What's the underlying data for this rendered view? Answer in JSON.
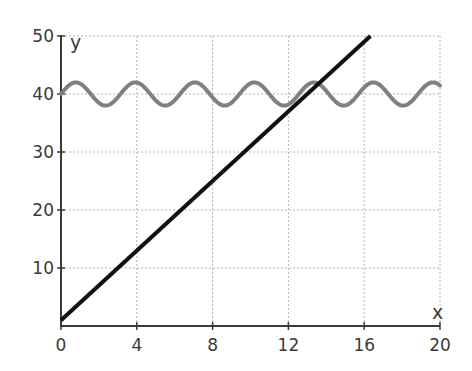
{
  "chart_data": {
    "type": "line",
    "title": "",
    "xlabel": "x",
    "ylabel": "y",
    "xlim": [
      0,
      20
    ],
    "ylim": [
      0,
      50
    ],
    "x_ticks": [
      0,
      4,
      8,
      12,
      16,
      20
    ],
    "y_ticks": [
      10,
      20,
      30,
      40,
      50
    ],
    "x_tick_labels": [
      "0",
      "4",
      "8",
      "12",
      "16",
      "20"
    ],
    "y_tick_labels": [
      "10",
      "20",
      "30",
      "40",
      "50"
    ],
    "grid": true,
    "legend": null,
    "series": [
      {
        "name": "linear",
        "color": "#111111",
        "equation": "y = 3x + 1",
        "x": [
          0,
          16.33
        ],
        "y": [
          1,
          50
        ]
      },
      {
        "name": "sinusoid",
        "color": "#808080",
        "equation": "y = 40 + 2 sin(2x)",
        "x_range": [
          0,
          20
        ],
        "amplitude": 2,
        "midline": 40,
        "period": 3.14
      }
    ]
  }
}
